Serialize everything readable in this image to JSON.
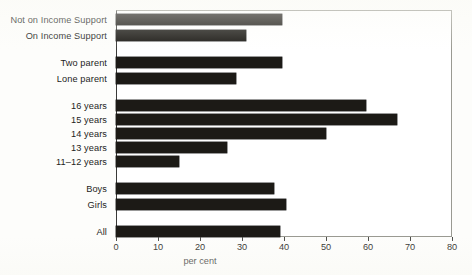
{
  "chart_data": {
    "type": "bar",
    "orientation": "horizontal",
    "title": "",
    "subtitle": "",
    "xlabel": "per cent",
    "ylabel": "",
    "xlim": [
      0,
      80
    ],
    "xticks": [
      0,
      10,
      20,
      30,
      40,
      50,
      60,
      70,
      80
    ],
    "xtick_labels": [
      "0",
      "10",
      "20",
      "30",
      "40",
      "50",
      "60",
      "70",
      "80"
    ],
    "grid": false,
    "legend": null,
    "bar_color": "#1c1a16",
    "categories": [
      "Not on Income Support",
      "On Income Support",
      "Two parent",
      "Lone parent",
      "16 years",
      "15 years",
      "14 years",
      "13 years",
      "11–12 years",
      "Boys",
      "Girls",
      "All"
    ],
    "values": [
      39.5,
      31,
      39.5,
      28.5,
      59.5,
      67,
      50,
      26.5,
      15,
      37.5,
      40.5,
      39
    ],
    "groups": [
      {
        "name": "Income Support",
        "categories": [
          "Not on Income Support",
          "On Income Support"
        ]
      },
      {
        "name": "Family type",
        "categories": [
          "Two parent",
          "Lone parent"
        ]
      },
      {
        "name": "Age",
        "categories": [
          "16 years",
          "15 years",
          "14 years",
          "13 years",
          "11–12 years"
        ]
      },
      {
        "name": "Sex",
        "categories": [
          "Boys",
          "Girls"
        ]
      },
      {
        "name": "Total",
        "categories": [
          "All"
        ]
      }
    ]
  },
  "axis": {
    "x_title": "per cent"
  }
}
